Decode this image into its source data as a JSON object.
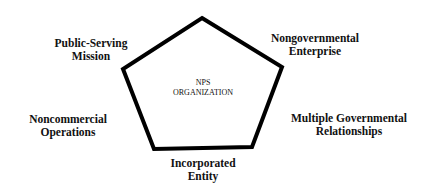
{
  "diagram": {
    "type": "pentagon",
    "stroke_color": "#000000",
    "background_color": "#ffffff",
    "center": {
      "line1": "NPS",
      "line2": "ORGANIZATION"
    },
    "attributes": [
      {
        "id": "public-serving-mission",
        "line1": "Public-Serving",
        "line2": "Mission"
      },
      {
        "id": "nongovernmental-enterprise",
        "line1": "Nongovernmental",
        "line2": "Enterprise"
      },
      {
        "id": "noncommercial-operations",
        "line1": "Noncommercial",
        "line2": "Operations"
      },
      {
        "id": "multiple-governmental-relationships",
        "line1": "Multiple Governmental",
        "line2": "Relationships"
      },
      {
        "id": "incorporated-entity",
        "line1": "Incorporated",
        "line2": "Entity"
      }
    ]
  }
}
